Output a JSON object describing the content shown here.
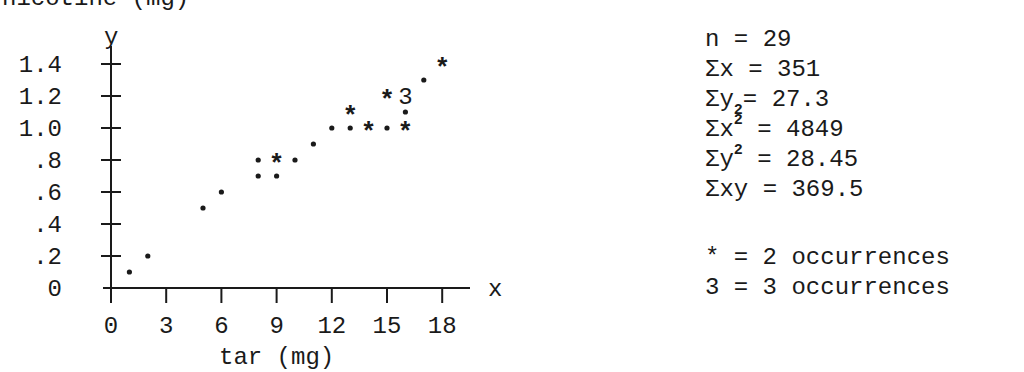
{
  "chart_data": {
    "type": "scatter",
    "title": "",
    "ylabel": "nicotine (mg)",
    "xlabel": "tar (mg)",
    "x_axis_symbol": "x",
    "y_axis_symbol": "y",
    "xlim": [
      0,
      19
    ],
    "ylim": [
      0,
      1.5
    ],
    "x_ticks": [
      0,
      3,
      6,
      9,
      12,
      15,
      18
    ],
    "x_tick_labels": [
      "0",
      "3",
      "6",
      "9",
      "12",
      "15",
      "18"
    ],
    "y_ticks": [
      0,
      0.2,
      0.4,
      0.6,
      0.8,
      1.0,
      1.2,
      1.4
    ],
    "y_tick_labels": [
      "0",
      ".2",
      ".4",
      ".6",
      ".8",
      "1.0",
      "1.2",
      "1.4"
    ],
    "grid": false,
    "points": [
      {
        "x": 1,
        "y": 0.1,
        "count": 1
      },
      {
        "x": 2,
        "y": 0.2,
        "count": 1
      },
      {
        "x": 5,
        "y": 0.5,
        "count": 1
      },
      {
        "x": 6,
        "y": 0.6,
        "count": 1
      },
      {
        "x": 8,
        "y": 0.7,
        "count": 1
      },
      {
        "x": 9,
        "y": 0.7,
        "count": 1
      },
      {
        "x": 8,
        "y": 0.8,
        "count": 1
      },
      {
        "x": 9,
        "y": 0.8,
        "count": 2
      },
      {
        "x": 10,
        "y": 0.8,
        "count": 1
      },
      {
        "x": 11,
        "y": 0.9,
        "count": 1
      },
      {
        "x": 12,
        "y": 1.0,
        "count": 1
      },
      {
        "x": 13,
        "y": 1.0,
        "count": 1
      },
      {
        "x": 14,
        "y": 1.0,
        "count": 2
      },
      {
        "x": 15,
        "y": 1.0,
        "count": 1
      },
      {
        "x": 16,
        "y": 1.0,
        "count": 2
      },
      {
        "x": 16,
        "y": 1.1,
        "count": 1
      },
      {
        "x": 13,
        "y": 1.1,
        "count": 2
      },
      {
        "x": 15,
        "y": 1.2,
        "count": 2
      },
      {
        "x": 16,
        "y": 1.2,
        "count": 3
      },
      {
        "x": 17,
        "y": 1.3,
        "count": 1
      },
      {
        "x": 18,
        "y": 1.4,
        "count": 2
      }
    ],
    "markers": {
      "1": "•",
      "2": "*",
      "3": "3"
    }
  },
  "stats": {
    "n": {
      "label": "n",
      "value": "29"
    },
    "sum_x": {
      "label": "Σx",
      "value": "351"
    },
    "sum_y": {
      "label": "Σy",
      "value": "27.3"
    },
    "sum_x2": {
      "label": "Σx",
      "value": "4849"
    },
    "sum_y2": {
      "label": "Σy",
      "value": "28.45"
    },
    "sum_xy": {
      "label": "Σxy",
      "value": "369.5"
    },
    "sup": "2",
    "eq": "="
  },
  "legend": [
    {
      "symbol": "*",
      "text": "= 2 occurrences"
    },
    {
      "symbol": "3",
      "text": "= 3 occurrences"
    }
  ]
}
